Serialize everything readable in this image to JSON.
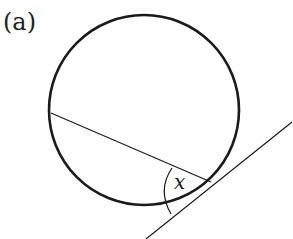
{
  "figure": {
    "label": "(a)",
    "angle_label": "x",
    "stroke_color": "#1a1a1a"
  }
}
